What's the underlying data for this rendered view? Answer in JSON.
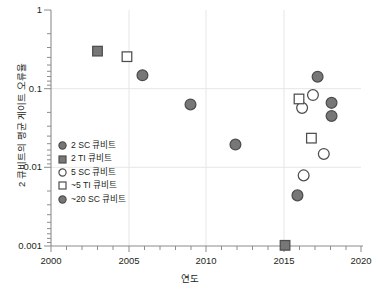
{
  "chart_data": {
    "type": "scatter",
    "title": "",
    "xlabel": "연도",
    "ylabel": "2 큐비트의 평균 게이트 오류율",
    "xlim": [
      2000,
      2020
    ],
    "ylim": [
      0.001,
      1
    ],
    "yscale": "log",
    "xticks": [
      2000,
      2005,
      2010,
      2015,
      2020
    ],
    "xtick_labels": [
      "2000",
      "2005",
      "2010",
      "2015",
      "2020"
    ],
    "yticks": [
      1,
      0.1,
      0.01,
      0.001
    ],
    "ytick_labels": [
      "1",
      "0.1",
      "0.01",
      "0.001"
    ],
    "grid": "major gridlines at 2005, 2010, 2015 and at 0.1, 0.01",
    "legend_position": "inside lower-left",
    "series": [
      {
        "name": "2 SC 큐비트",
        "marker": "filled-circle",
        "color": "#777777",
        "edge": "#4d4d4d",
        "points": [
          {
            "x": 2005.9,
            "y": 0.148
          },
          {
            "x": 2009.0,
            "y": 0.063
          },
          {
            "x": 2011.9,
            "y": 0.0195
          },
          {
            "x": 2015.9,
            "y": 0.0044
          }
        ]
      },
      {
        "name": "2 TI 큐비트",
        "marker": "filled-square",
        "color": "#777777",
        "edge": "#4d4d4d",
        "points": [
          {
            "x": 2003.0,
            "y": 0.3
          },
          {
            "x": 2015.1,
            "y": 0.00102
          }
        ]
      },
      {
        "name": "5 SC 큐비트",
        "marker": "open-circle",
        "color": "#ffffff",
        "edge": "#4d4d4d",
        "points": [
          {
            "x": 2016.9,
            "y": 0.083
          },
          {
            "x": 2016.2,
            "y": 0.057
          },
          {
            "x": 2016.3,
            "y": 0.0079
          },
          {
            "x": 2017.6,
            "y": 0.0148
          }
        ]
      },
      {
        "name": "~5 TI 큐비트",
        "marker": "open-square",
        "color": "#ffffff",
        "edge": "#4d4d4d",
        "points": [
          {
            "x": 2004.9,
            "y": 0.255
          },
          {
            "x": 2016.0,
            "y": 0.074
          },
          {
            "x": 2016.8,
            "y": 0.0235
          }
        ]
      },
      {
        "name": "~20 SC 큐비트",
        "marker": "filled-circle",
        "color": "#777777",
        "edge": "#4d4d4d",
        "points": [
          {
            "x": 2017.2,
            "y": 0.142
          },
          {
            "x": 2018.1,
            "y": 0.066
          },
          {
            "x": 2018.1,
            "y": 0.045
          }
        ]
      }
    ]
  },
  "axes": {
    "y_title": "2 큐비트의 평균 게이트 오류율",
    "x_title": "연도",
    "y_labels": [
      "1",
      "0.1",
      "0.01",
      "0.001"
    ],
    "x_labels": [
      "2000",
      "2005",
      "2010",
      "2015",
      "2020"
    ]
  },
  "legend": {
    "items": [
      {
        "label": "2 SC 큐비트",
        "marker": "filled-circle"
      },
      {
        "label": "2 TI 큐비트",
        "marker": "filled-square"
      },
      {
        "label": "5 SC 큐비트",
        "marker": "open-circle"
      },
      {
        "label": "~5 TI 큐비트",
        "marker": "open-square"
      },
      {
        "label": "~20 SC 큐비트",
        "marker": "filled-circle"
      }
    ]
  },
  "colors": {
    "marker_fill": "#777777",
    "marker_edge": "#4d4d4d",
    "axis": "#808080",
    "grid": "#e3e3e3",
    "text": "#231f20",
    "background": "#ffffff"
  }
}
